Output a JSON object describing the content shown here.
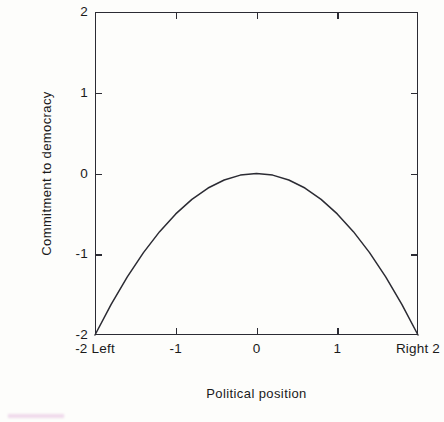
{
  "figure": {
    "background_color": "#fdfdfb",
    "ink_color": "#2b2b33",
    "scan_artifact_color": "#e4bede"
  },
  "chart_data": {
    "type": "line",
    "title": "",
    "subtitle": "",
    "xlabel": "Political position",
    "ylabel": "Commitment to democracy",
    "xlim": [
      -2,
      2
    ],
    "ylim": [
      -2,
      2
    ],
    "grid": false,
    "legend": null,
    "legend_position": "none",
    "x_ticks": [
      -2,
      -1,
      0,
      1,
      2
    ],
    "x_tick_labels": [
      "-2 Left",
      "-1",
      "0",
      "1",
      "Right 2"
    ],
    "y_ticks": [
      -2,
      -1,
      0,
      1,
      2
    ],
    "y_tick_labels": [
      "2",
      "1",
      "0",
      "-1",
      "-2"
    ],
    "tick_direction": "in",
    "frame": "box",
    "series": [
      {
        "name": "Commitment to democracy",
        "curve": "inverted parabola peaking at (0, 0)",
        "equation": "y = -x^2 / 2",
        "color": "#2b2b33",
        "line_width": 1.4,
        "x": [
          -2,
          -1.8,
          -1.6,
          -1.4,
          -1.2,
          -1,
          -0.8,
          -0.6,
          -0.4,
          -0.2,
          0,
          0.2,
          0.4,
          0.6,
          0.8,
          1,
          1.2,
          1.4,
          1.6,
          1.8,
          2
        ],
        "values": [
          -2,
          -1.62,
          -1.28,
          -0.98,
          -0.72,
          -0.5,
          -0.32,
          -0.18,
          -0.08,
          -0.02,
          0,
          -0.02,
          -0.08,
          -0.18,
          -0.32,
          -0.5,
          -0.72,
          -0.98,
          -1.28,
          -1.62,
          -2
        ]
      }
    ]
  },
  "axis_labels": {
    "y_title": "Commitment to democracy",
    "x_title": "Political position"
  },
  "y_tick_entries": [
    {
      "label": "2",
      "value": 2
    },
    {
      "label": "1",
      "value": 1
    },
    {
      "label": "0",
      "value": 0
    },
    {
      "label": "-1",
      "value": -1
    },
    {
      "label": "-2",
      "value": -2
    }
  ],
  "x_tick_entries": [
    {
      "label": "-2 Left",
      "value": -2
    },
    {
      "label": "-1",
      "value": -1
    },
    {
      "label": "0",
      "value": 0
    },
    {
      "label": "1",
      "value": 1
    },
    {
      "label": "Right 2",
      "value": 2
    }
  ]
}
